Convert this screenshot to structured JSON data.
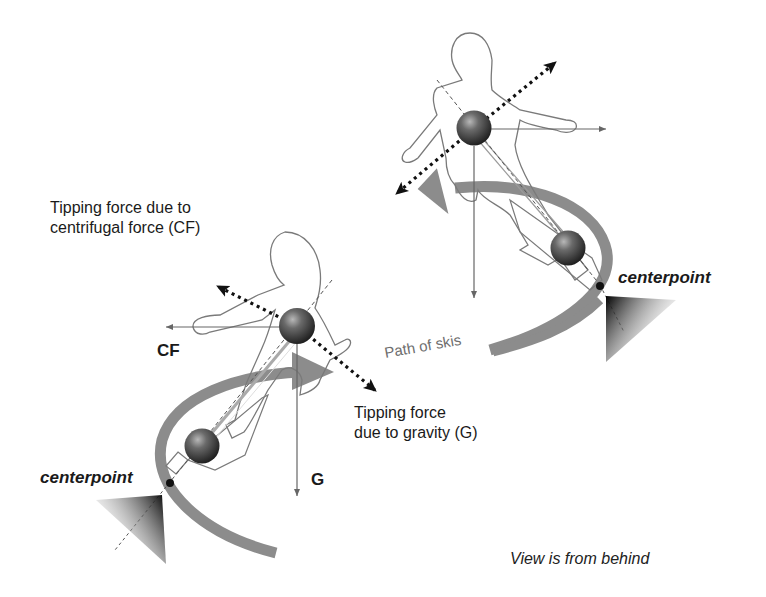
{
  "diagram": {
    "labels": {
      "cf_tipping_line1": "Tipping force due to",
      "cf_tipping_line2": "centrifugal force (CF)",
      "cf_short": "CF",
      "g_tipping_line1": "Tipping force",
      "g_tipping_line2": "due to gravity (G)",
      "g_short": "G",
      "path": "Path of skis",
      "centerpoint_lower": "centerpoint",
      "centerpoint_upper": "centerpoint",
      "view_note": "View is from behind"
    },
    "skiers": [
      {
        "id": "lower",
        "center_of_mass": [
          297,
          326
        ],
        "foot_mass": [
          202,
          445
        ],
        "centerpoint": [
          170,
          482
        ],
        "forces": [
          "CF",
          "G",
          "tipping-CF",
          "tipping-G"
        ]
      },
      {
        "id": "upper",
        "center_of_mass": [
          474,
          128
        ],
        "foot_mass": [
          568,
          248
        ],
        "centerpoint": [
          600,
          285
        ],
        "forces": [
          "CF",
          "G",
          "tipping-CF",
          "tipping-G"
        ]
      }
    ],
    "colors": {
      "background": "#ffffff",
      "outline": "#7a7a7a",
      "path_arrow": "#8c8c8c",
      "ball_dark": "#2a2a2a",
      "ball_light": "#9a9a9a",
      "dotted_arrow": "#111111",
      "text": "#1a1a1a",
      "path_text": "#6e6e6e"
    }
  }
}
